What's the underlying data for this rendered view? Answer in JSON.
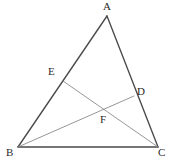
{
  "figure": {
    "type": "euclidean-geometry-diagram",
    "background_color": "#ffffff",
    "stroke_colors": {
      "triangle_side": "#4a4a4a",
      "cevian": "#8a8a8a",
      "right_angle_mark": "#6e6e6e"
    },
    "label_color": "#2b2b2b",
    "points": [
      {
        "name": "A",
        "label": "A",
        "x": 107,
        "y": 16,
        "label_x": 103,
        "label_y": 1
      },
      {
        "name": "B",
        "label": "B",
        "x": 18,
        "y": 147,
        "label_x": 6,
        "label_y": 147
      },
      {
        "name": "C",
        "label": "C",
        "x": 158,
        "y": 147,
        "label_x": 158,
        "label_y": 147
      },
      {
        "name": "D",
        "label": "D",
        "x": 134,
        "y": 96,
        "label_x": 137,
        "label_y": 86
      },
      {
        "name": "E",
        "label": "E",
        "x": 63,
        "y": 81,
        "label_x": 48,
        "label_y": 66
      },
      {
        "name": "F",
        "label": "F",
        "x": 105,
        "y": 106,
        "label_x": 100,
        "label_y": 114
      }
    ],
    "segments": [
      {
        "name": "side-AB",
        "from": "A",
        "to": "B",
        "style": "triangle_side"
      },
      {
        "name": "side-AC",
        "from": "A",
        "to": "C",
        "style": "triangle_side"
      },
      {
        "name": "side-BC",
        "from": "B",
        "to": "C",
        "style": "triangle_side"
      },
      {
        "name": "cevian-BD",
        "from": "B",
        "to": "D",
        "style": "cevian"
      },
      {
        "name": "cevian-CE",
        "from": "C",
        "to": "E",
        "style": "cevian"
      }
    ],
    "right_angles": [
      {
        "name": "right-angle-at-E",
        "at": "E",
        "size": 8
      },
      {
        "name": "right-angle-at-D",
        "at": "D",
        "size": 8
      }
    ]
  }
}
